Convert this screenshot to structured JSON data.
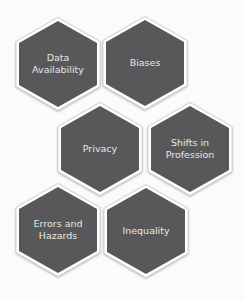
{
  "diagram": {
    "type": "hexagon-cluster",
    "colors": {
      "background": "#fbfbfb",
      "hex_fill": "#58585a",
      "hex_border": "#ffffff",
      "hex_outline": "#c9c9c9",
      "label_text": "#e6e6e6"
    },
    "hexagons": [
      {
        "id": "data-availability",
        "line1": "Data",
        "line2": "Availability",
        "cx": 58,
        "cy": 64
      },
      {
        "id": "biases",
        "line1": "Biases",
        "line2": "",
        "cx": 145,
        "cy": 63
      },
      {
        "id": "privacy",
        "line1": "Privacy",
        "line2": "",
        "cx": 100,
        "cy": 149
      },
      {
        "id": "shifts-in-profession",
        "line1": "Shifts in",
        "line2": "Profession",
        "cx": 190,
        "cy": 149
      },
      {
        "id": "errors-and-hazards",
        "line1": "Errors and",
        "line2": "Hazards",
        "cx": 58,
        "cy": 230
      },
      {
        "id": "inequality",
        "line1": "Inequality",
        "line2": "",
        "cx": 146,
        "cy": 231
      }
    ]
  }
}
